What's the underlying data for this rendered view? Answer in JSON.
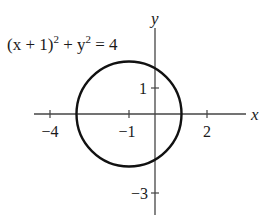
{
  "figure": {
    "equation": {
      "lhs_part1": "(x + 1)",
      "exp1": "2",
      "plus": " + y",
      "exp2": "2",
      "rhs": " = 4"
    },
    "axes": {
      "x_label": "x",
      "y_label": "y",
      "x_ticks": [
        {
          "value": -4,
          "label": "−4"
        },
        {
          "value": -1,
          "label": "−1"
        },
        {
          "value": 2,
          "label": "2"
        }
      ],
      "y_ticks": [
        {
          "value": 1,
          "label": "1"
        },
        {
          "value": -3,
          "label": "−3"
        }
      ]
    },
    "circle": {
      "center": [
        -1,
        0
      ],
      "radius": 2,
      "stroke_color": "#111111"
    }
  }
}
